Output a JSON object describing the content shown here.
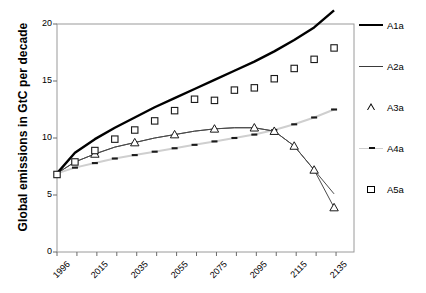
{
  "chart_data": {
    "type": "line",
    "title": "",
    "xlabel": "",
    "ylabel": "Global emissions in GtC per decade",
    "xlim": [
      1996,
      2145
    ],
    "ylim": [
      0,
      20
    ],
    "yticks": [
      0,
      5,
      10,
      15,
      20
    ],
    "xticks": [
      1996,
      2015,
      2035,
      2055,
      2075,
      2095,
      2115,
      2135
    ],
    "xtick_labels": [
      "1996",
      "2015",
      "2035",
      "2055",
      "2075",
      "2095",
      "2115",
      "2135"
    ],
    "grid": false,
    "legend_position": "right",
    "x": [
      1996,
      2005,
      2015,
      2025,
      2035,
      2045,
      2055,
      2065,
      2075,
      2085,
      2095,
      2105,
      2115,
      2125,
      2135
    ],
    "series": [
      {
        "name": "A1a",
        "style": "thick-solid-black",
        "color": "#000000",
        "values": [
          6.9,
          8.7,
          9.9,
          10.9,
          11.8,
          12.7,
          13.5,
          14.3,
          15.1,
          15.9,
          16.7,
          17.6,
          18.6,
          19.7,
          21.2
        ]
      },
      {
        "name": "A2a",
        "style": "thin-solid-gray",
        "color": "#4a4a4a",
        "values": [
          6.9,
          7.9,
          8.6,
          9.2,
          9.6,
          10.0,
          10.3,
          10.6,
          10.8,
          10.9,
          10.9,
          10.6,
          9.3,
          7.2,
          5.1
        ]
      },
      {
        "name": "A3a",
        "style": "triangle-markers",
        "color": "#000000",
        "marker": "triangle",
        "values": [
          6.9,
          7.9,
          8.6,
          9.2,
          9.6,
          10.0,
          10.3,
          10.6,
          10.8,
          10.9,
          10.9,
          10.6,
          9.3,
          7.2,
          3.9
        ]
      },
      {
        "name": "A4a",
        "style": "dash-dot-light",
        "color": "#cfcfcf",
        "values": [
          6.9,
          7.4,
          7.8,
          8.2,
          8.5,
          8.8,
          9.1,
          9.4,
          9.7,
          10.0,
          10.3,
          10.7,
          11.2,
          11.8,
          12.5
        ]
      },
      {
        "name": "A5a",
        "style": "square-markers",
        "color": "#000000",
        "marker": "square",
        "values": [
          6.8,
          7.9,
          8.9,
          9.9,
          10.7,
          11.5,
          12.4,
          13.4,
          13.3,
          14.2,
          14.4,
          15.2,
          16.1,
          16.9,
          17.9
        ]
      }
    ],
    "legend": [
      {
        "label": "A1a",
        "key": "line-thick"
      },
      {
        "label": "A2a",
        "key": "line-thin"
      },
      {
        "label": "A3a",
        "key": "triangle"
      },
      {
        "label": "A4a",
        "key": "dash-dot"
      },
      {
        "label": "A5a",
        "key": "square"
      }
    ]
  }
}
